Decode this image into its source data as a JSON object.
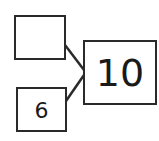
{
  "diagram": {
    "type": "number-bond",
    "parts": [
      {
        "id": "part-top",
        "value": ""
      },
      {
        "id": "part-bottom",
        "value": "6"
      }
    ],
    "whole": {
      "value": "10"
    }
  }
}
